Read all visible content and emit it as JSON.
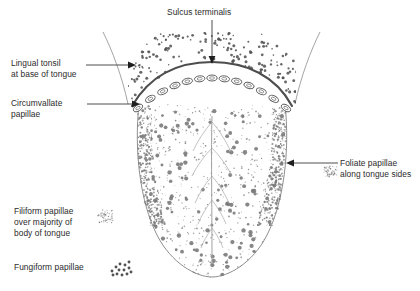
{
  "figure": {
    "colors": {
      "outline": "#8a8a8a",
      "sulcus_terminalis": "#4a4a4a",
      "papilla_dot": "#7a7a7a",
      "lingual_tonsil_dot": "#4e4e4e",
      "text": "#2b2b2b",
      "leader_line": "#3a3a3a",
      "background": "#ffffff"
    }
  },
  "labels": {
    "sulcus_terminalis": "Sulcus terminalis",
    "lingual_tonsil_line1": "Lingual tonsil",
    "lingual_tonsil_line2": "at base of tongue",
    "circumvallate_line1": "Circumvallate",
    "circumvallate_line2": "papillae",
    "filiform_line1": "Filiform papillae",
    "filiform_line2": "over majority of",
    "filiform_line3": "body of tongue",
    "fungiform": "Fungiform papillae",
    "foliate_line1": "Foliate papillae",
    "foliate_line2": "along tongue sides"
  },
  "icons": {
    "sulcus_arrow": "down-arrow-icon",
    "lingual_arrow": "right-arrow-icon",
    "circumvallate_arrow": "right-arrow-icon",
    "foliate_arrow": "left-arrow-icon",
    "filiform_swatch": "filiform-dot-cluster-icon",
    "fungiform_swatch": "fungiform-dot-cluster-icon",
    "foliate_swatch": "foliate-dot-cluster-icon"
  },
  "structures": [
    {
      "name": "sulcus-terminalis",
      "kind": "arc"
    },
    {
      "name": "circumvallate-papillae",
      "kind": "ellipse-row",
      "count": 13
    },
    {
      "name": "lingual-tonsil",
      "kind": "dot-field"
    },
    {
      "name": "filiform-papillae",
      "kind": "dot-field"
    },
    {
      "name": "fungiform-papillae",
      "kind": "dot-field"
    },
    {
      "name": "foliate-papillae",
      "kind": "dot-field"
    },
    {
      "name": "median-sulcus",
      "kind": "line"
    },
    {
      "name": "tongue-outline",
      "kind": "outline"
    },
    {
      "name": "palatoglossal-arch-left",
      "kind": "line"
    },
    {
      "name": "palatoglossal-arch-right",
      "kind": "line"
    }
  ]
}
